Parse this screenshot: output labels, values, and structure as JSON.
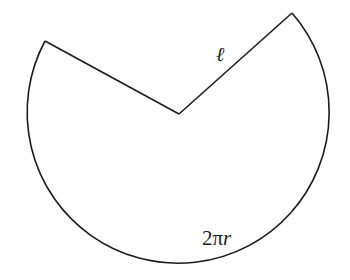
{
  "diagram": {
    "type": "unrolled-cone-sector",
    "stroke_color": "#1c1c1c",
    "background_color": "#ffffff",
    "geometry": {
      "center": [
        179,
        114
      ],
      "radius": 151,
      "left_vertex": [
        45,
        41
      ],
      "right_vertex": [
        292,
        13
      ]
    },
    "labels": {
      "slant_height": "ℓ",
      "arc_length_coefficient": "2π",
      "arc_length_variable": "r"
    }
  }
}
